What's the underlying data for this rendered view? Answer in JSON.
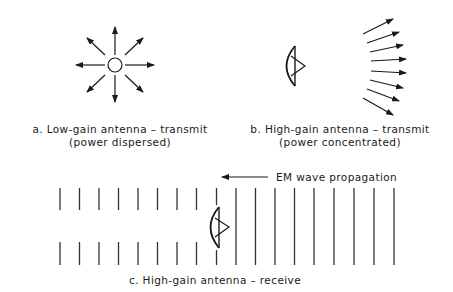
{
  "colors": {
    "ink": "#1a1a1a",
    "background": "#ffffff"
  },
  "panel_a": {
    "title": "a. Low-gain antenna – transmit",
    "subtitle": "(power dispersed)",
    "element": "isotropic-antenna-circle",
    "arrows": 8
  },
  "panel_b": {
    "title": "b. High-gain antenna – transmit",
    "subtitle": "(power concentrated)",
    "element": "parabolic-dish-antenna",
    "arrows": 8
  },
  "panel_c": {
    "title": "c. High-gain antenna – receive",
    "propagation_label": "EM wave propagation",
    "element": "parabolic-dish-antenna",
    "wavefronts_blocked": 9,
    "wavefronts_full": 9
  }
}
